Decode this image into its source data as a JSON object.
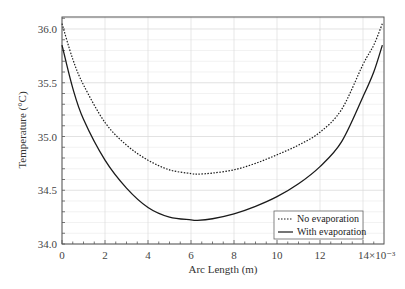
{
  "chart_data": {
    "type": "line",
    "title": "",
    "xlabel": "Arc Length (m)",
    "ylabel": "Temperature (°C)",
    "x_scale_note": "×10⁻³",
    "xlim": [
      0,
      14.9
    ],
    "ylim": [
      34.0,
      36.11
    ],
    "xticks": [
      "0",
      "2",
      "4",
      "6",
      "8",
      "10",
      "12",
      "14×10⁻³"
    ],
    "xtick_values": [
      0,
      2,
      4,
      6,
      8,
      10,
      12,
      14
    ],
    "yticks": [
      "34.0",
      "34.5",
      "35.0",
      "35.5",
      "36.0"
    ],
    "ytick_values": [
      34.0,
      34.5,
      35.0,
      35.5,
      36.0
    ],
    "grid": true,
    "legend_position": "lower right",
    "series": [
      {
        "name": "No evaporation",
        "style": "dotted",
        "x": [
          0,
          0.5,
          1,
          2,
          3,
          4,
          5,
          6,
          6.3,
          7,
          8,
          9,
          10,
          11,
          12,
          13,
          14,
          14.5,
          14.9
        ],
        "y": [
          36.05,
          35.72,
          35.48,
          35.13,
          34.92,
          34.78,
          34.69,
          34.655,
          34.65,
          34.66,
          34.69,
          34.75,
          34.83,
          34.92,
          35.04,
          35.25,
          35.67,
          35.85,
          36.05
        ]
      },
      {
        "name": "With evaporation",
        "style": "solid",
        "x": [
          0,
          0.5,
          1,
          2,
          3,
          4,
          5,
          6,
          6.3,
          7,
          8,
          9,
          10,
          11,
          12,
          13,
          14,
          14.5,
          14.9
        ],
        "y": [
          35.85,
          35.45,
          35.16,
          34.78,
          34.52,
          34.34,
          34.25,
          34.225,
          34.22,
          34.235,
          34.28,
          34.35,
          34.44,
          34.56,
          34.72,
          34.95,
          35.37,
          35.6,
          35.85
        ]
      }
    ]
  },
  "legend": {
    "items": [
      {
        "label": "No evaporation"
      },
      {
        "label": "With evaporation"
      }
    ]
  },
  "colors": {
    "line": "#1a1a1a",
    "grid": "#e4e4e4",
    "axis": "#555555"
  }
}
